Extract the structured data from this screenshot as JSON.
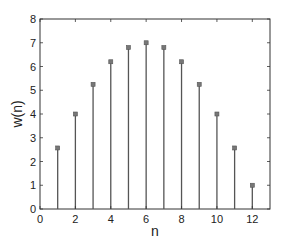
{
  "chart_data": {
    "type": "stem",
    "title": "",
    "xlabel": "n",
    "ylabel": "w(n)",
    "x": [
      1,
      2,
      3,
      4,
      5,
      6,
      7,
      8,
      9,
      10,
      11,
      12
    ],
    "values": [
      2.57,
      4.0,
      5.25,
      6.2,
      6.8,
      7.0,
      6.8,
      6.2,
      5.25,
      4.0,
      2.57,
      1.0
    ],
    "xlim": [
      0,
      13
    ],
    "ylim": [
      0,
      8
    ],
    "xticks": [
      0,
      2,
      4,
      6,
      8,
      10,
      12
    ],
    "yticks": [
      0,
      1,
      2,
      3,
      4,
      5,
      6,
      7,
      8
    ],
    "grid": false,
    "legend": null,
    "colors": {
      "stem": "#555555",
      "marker": "#777777",
      "axis": "#333333"
    }
  }
}
